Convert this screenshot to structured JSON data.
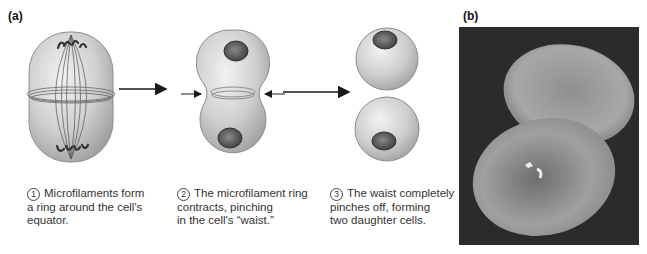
{
  "panel_a": {
    "label": "(a)",
    "steps": [
      {
        "number": "1",
        "text": "Microfilaments form\na ring around the cell's\nequator."
      },
      {
        "number": "2",
        "text": "The microfilament ring\ncontracts, pinching\nin the cell's “waist.”"
      },
      {
        "number": "3",
        "text": "The waist completely\npinches off, forming\ntwo daughter cells."
      }
    ]
  },
  "panel_b": {
    "label": "(b)",
    "image_description": "Scanning electron micrograph of a cell pinching into two daughter cells"
  },
  "colors": {
    "cell_fill": "#c9c9c9",
    "cell_edge": "#8e8e8e",
    "nucleus": "#5a5a5a",
    "arrow": "#1a1a1a",
    "photo_bg": "#2b2b2b"
  }
}
